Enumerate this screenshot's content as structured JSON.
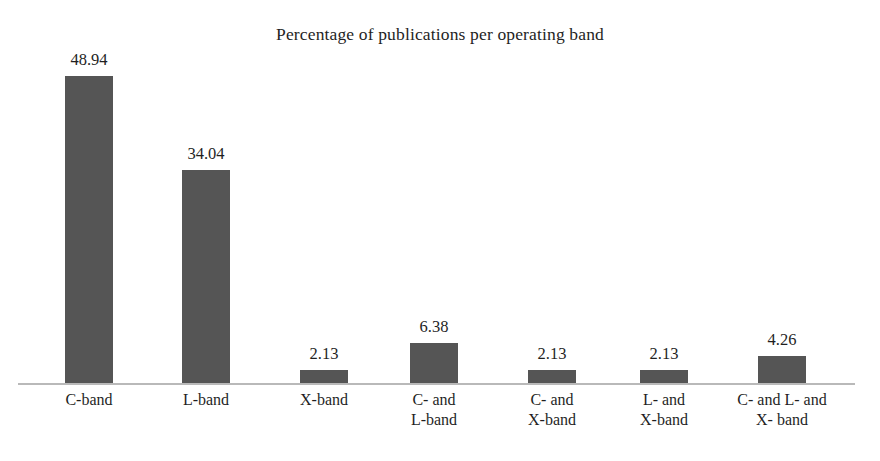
{
  "chart_data": {
    "type": "bar",
    "title": "Percentage of publications per operating band",
    "xlabel": "",
    "ylabel": "",
    "ylim": [
      0,
      50
    ],
    "grid": false,
    "legend": null,
    "axis_visible": "x-only",
    "categories": [
      "C-band",
      "L-band",
      "X-band",
      "C- and\nL-band",
      "C- and\nX-band",
      "L- and\nX-band",
      "C- and L- and\nX- band"
    ],
    "values": [
      48.94,
      34.04,
      2.13,
      6.38,
      2.13,
      2.13,
      4.26
    ],
    "value_labels": [
      "48.94",
      "34.04",
      "2.13",
      "6.38",
      "2.13",
      "2.13",
      "4.26"
    ],
    "bar_color": "#555555",
    "axis_color": "#b9b9b9",
    "text_color": "#1f1f1f"
  },
  "bars": [
    {
      "label": "C-band",
      "value": 48.94,
      "value_label": "48.94",
      "x": 65,
      "width": 48,
      "line1": "C-band",
      "line2": ""
    },
    {
      "label": "L-band",
      "value": 34.04,
      "value_label": "34.04",
      "x": 182,
      "width": 48,
      "line1": "L-band",
      "line2": ""
    },
    {
      "label": "X-band",
      "value": 2.13,
      "value_label": "2.13",
      "x": 300,
      "width": 48,
      "line1": "X-band",
      "line2": ""
    },
    {
      "label": "C- and L-band",
      "value": 6.38,
      "value_label": "6.38",
      "x": 410,
      "width": 48,
      "line1": "C- and",
      "line2": "L-band"
    },
    {
      "label": "C- and X-band",
      "value": 2.13,
      "value_label": "2.13",
      "x": 528,
      "width": 48,
      "line1": "C- and",
      "line2": "X-band"
    },
    {
      "label": "L- and X-band",
      "value": 2.13,
      "value_label": "2.13",
      "x": 640,
      "width": 48,
      "line1": "L- and",
      "line2": "X-band"
    },
    {
      "label": "C- and L- and X- band",
      "value": 4.26,
      "value_label": "4.26",
      "x": 758,
      "width": 48,
      "line1": "C- and L- and",
      "line2": "X- band"
    }
  ]
}
